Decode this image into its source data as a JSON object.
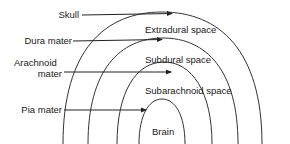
{
  "diagram": {
    "layers": [
      {
        "label": "Skull"
      },
      {
        "label": "Dura mater"
      },
      {
        "label": "Arachnoid mater",
        "line1": "Arachnoid",
        "line2": "mater"
      },
      {
        "label": "Pia mater"
      }
    ],
    "spaces": [
      {
        "label": "Extradural space"
      },
      {
        "label": "Subdural space"
      },
      {
        "label": "Subarachnoid space"
      },
      {
        "label": "Brain"
      }
    ],
    "colors": {
      "line": "#333333",
      "text": "#1a1a1a",
      "background": "#ffffff"
    }
  }
}
